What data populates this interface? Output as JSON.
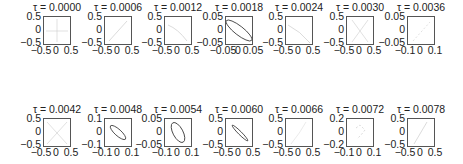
{
  "chart_data": [
    {
      "type": "line",
      "title": "τ = 0.0000",
      "xlim": [
        -0.5,
        0.5
      ],
      "ylim": [
        -0.5,
        0.5
      ],
      "xticks": [
        "−0.5",
        "0",
        "0.5"
      ],
      "yticks": [
        "0.5",
        "0",
        "−0.5"
      ],
      "curve": "faint cross near center"
    },
    {
      "type": "line",
      "title": "τ = 0.0006",
      "xlim": [
        -0.5,
        0.5
      ],
      "ylim": [
        -0.5,
        0.5
      ],
      "xticks": [
        "−0.5",
        "0",
        "0.5"
      ],
      "yticks": [
        "0.5",
        "0",
        "−0.5"
      ],
      "curve": "faint diagonal line"
    },
    {
      "type": "line",
      "title": "τ = 0.0012",
      "xlim": [
        -0.5,
        0.5
      ],
      "ylim": [
        -0.5,
        0.5
      ],
      "xticks": [
        "−0.5",
        "0",
        "0.5"
      ],
      "yticks": [
        "0.5",
        "0",
        "−0.5"
      ],
      "curve": "faint curve"
    },
    {
      "type": "line",
      "title": "τ = 0.0018",
      "xlim": [
        -0.05,
        0.05
      ],
      "ylim": [
        -0.05,
        0.05
      ],
      "xticks": [
        "−0.05",
        "0",
        "0.05"
      ],
      "yticks": [
        "0.05",
        "0",
        "−0.05"
      ],
      "curve": "tilted ellipse (negative slope)"
    },
    {
      "type": "line",
      "title": "τ = 0.0024",
      "xlim": [
        -0.5,
        0.5
      ],
      "ylim": [
        -0.5,
        0.5
      ],
      "xticks": [
        "−0.5",
        "0",
        "0.5"
      ],
      "yticks": [
        "0.5",
        "0",
        "−0.5"
      ],
      "curve": "faint curve"
    },
    {
      "type": "line",
      "title": "τ = 0.0030",
      "xlim": [
        -0.5,
        0.5
      ],
      "ylim": [
        -0.5,
        0.5
      ],
      "xticks": [
        "−0.5",
        "0",
        "0.5"
      ],
      "yticks": [
        "0.5",
        "0",
        "−0.5"
      ],
      "curve": "faint X"
    },
    {
      "type": "line",
      "title": "τ = 0.0036",
      "xlim": [
        -0.1,
        0.1
      ],
      "ylim": [
        -0.05,
        0.05
      ],
      "xticks": [
        "−0.1",
        "0",
        "0.1"
      ],
      "yticks": [
        "0.05",
        "0",
        "−0.05"
      ],
      "curve": "faint diagonal"
    },
    {
      "type": "line",
      "title": "τ = 0.0042",
      "xlim": [
        -0.5,
        0.5
      ],
      "ylim": [
        -0.5,
        0.5
      ],
      "xticks": [
        "−0.5",
        "0",
        "0.5"
      ],
      "yticks": [
        "0.5",
        "0",
        "−0.5"
      ],
      "curve": "faint X"
    },
    {
      "type": "line",
      "title": "τ = 0.0048",
      "xlim": [
        -0.1,
        0.1
      ],
      "ylim": [
        -0.1,
        0.1
      ],
      "xticks": [
        "−0.1",
        "0",
        "0.1"
      ],
      "yticks": [
        "0.1",
        "0",
        "−0.1"
      ],
      "curve": "narrow tilted ellipse (negative slope)"
    },
    {
      "type": "line",
      "title": "τ = 0.0054",
      "xlim": [
        -0.1,
        0.1
      ],
      "ylim": [
        -0.05,
        0.05
      ],
      "xticks": [
        "−0.1",
        "0",
        "0.1"
      ],
      "yticks": [
        "0.05",
        "0",
        "−0.05"
      ],
      "curve": "tilted ellipse (negative slope)"
    },
    {
      "type": "line",
      "title": "τ = 0.0060",
      "xlim": [
        -0.5,
        0.5
      ],
      "ylim": [
        -0.5,
        0.5
      ],
      "xticks": [
        "−0.5",
        "0",
        "0.5"
      ],
      "yticks": [
        "0.5",
        "0",
        "−0.5"
      ],
      "curve": "very narrow tilted ellipse (negative slope)"
    },
    {
      "type": "line",
      "title": "τ = 0.0066",
      "xlim": [
        -0.5,
        0.5
      ],
      "ylim": [
        -0.5,
        0.5
      ],
      "xticks": [
        "−0.5",
        "0",
        "0.5"
      ],
      "yticks": [
        "0.5",
        "0",
        "−0.5"
      ],
      "curve": "faint curve"
    },
    {
      "type": "line",
      "title": "τ = 0.0072",
      "xlim": [
        -0.1,
        0.1
      ],
      "ylim": [
        -0.2,
        0.2
      ],
      "xticks": [
        "−0.1",
        "0",
        "0.1"
      ],
      "yticks": [
        "0.2",
        "0",
        "−0.2"
      ],
      "curve": "faint dashed loop"
    },
    {
      "type": "line",
      "title": "τ = 0.0078",
      "xlim": [
        -0.5,
        0.5
      ],
      "ylim": [
        -0.5,
        0.5
      ],
      "xticks": [
        "−0.5",
        "0",
        "0.5"
      ],
      "yticks": [
        "0.5",
        "0",
        "−0.5"
      ],
      "curve": "faint diagonal (positive slope)"
    }
  ]
}
